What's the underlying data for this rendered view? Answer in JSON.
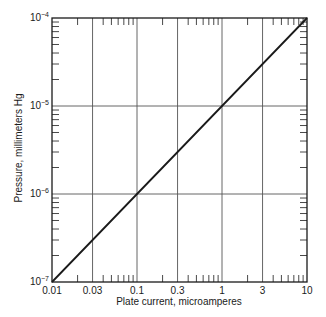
{
  "chart_data": {
    "type": "line",
    "title": "",
    "xlabel": "Plate current, microamperes",
    "ylabel": "Pressure, millimeters Hg",
    "xscale": "log",
    "yscale": "log",
    "xlim": [
      0.01,
      10
    ],
    "ylim": [
      1e-07,
      0.0001
    ],
    "xticks": [
      0.01,
      0.03,
      0.1,
      0.3,
      1,
      3,
      10
    ],
    "xtick_labels": [
      "0.01",
      "0.03",
      "0.1",
      "0.3",
      "1",
      "3",
      "10"
    ],
    "yticks": [
      1e-07,
      1e-06,
      1e-05,
      0.0001
    ],
    "ytick_labels": [
      "10^-7",
      "10^-6",
      "10^-5",
      "10^-4"
    ],
    "grid": true,
    "legend": null,
    "series": [
      {
        "name": "Pressure vs plate current",
        "x": [
          0.01,
          0.03,
          0.1,
          0.3,
          1,
          3,
          10
        ],
        "y": [
          1e-07,
          3e-07,
          1e-06,
          3e-06,
          1e-05,
          3e-05,
          0.0001
        ]
      }
    ]
  },
  "axis": {
    "xlabel": "Plate current, microamperes",
    "ylabel": "Pressure, millimeters Hg"
  }
}
